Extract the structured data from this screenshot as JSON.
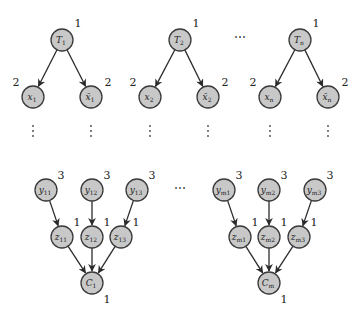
{
  "diagram": {
    "type": "directed-graph",
    "variable_gadgets": [
      {
        "root": {
          "id": "T1",
          "base": "T",
          "sub": "1",
          "weight": "1",
          "x": 62,
          "y": 40
        },
        "children": [
          {
            "id": "x1",
            "base": "x",
            "sub": "1",
            "bar": false,
            "weight": "2",
            "x": 33,
            "y": 97,
            "weight_side": "left"
          },
          {
            "id": "xbar1",
            "base": "x̄",
            "sub": "1",
            "bar": true,
            "weight": "2",
            "x": 91,
            "y": 97,
            "weight_side": "right"
          }
        ]
      },
      {
        "root": {
          "id": "T2",
          "base": "T",
          "sub": "2",
          "weight": "1",
          "x": 180,
          "y": 40
        },
        "children": [
          {
            "id": "x2",
            "base": "x",
            "sub": "2",
            "bar": false,
            "weight": "2",
            "x": 150,
            "y": 97,
            "weight_side": "left"
          },
          {
            "id": "xbar2",
            "base": "x̄",
            "sub": "2",
            "bar": true,
            "weight": "2",
            "x": 208,
            "y": 97,
            "weight_side": "right"
          }
        ]
      },
      {
        "root": {
          "id": "Tn",
          "base": "T",
          "sub": "n",
          "weight": "1",
          "x": 300,
          "y": 40
        },
        "children": [
          {
            "id": "xn",
            "base": "x",
            "sub": "n",
            "bar": false,
            "weight": "2",
            "x": 270,
            "y": 97,
            "weight_side": "left"
          },
          {
            "id": "xbarn",
            "base": "x̄",
            "sub": "n",
            "bar": true,
            "weight": "2",
            "x": 328,
            "y": 97,
            "weight_side": "right"
          }
        ]
      }
    ],
    "clause_gadgets": [
      {
        "sink": {
          "id": "C1",
          "base": "C",
          "sub": "1",
          "weight": "1",
          "x": 92,
          "y": 283
        },
        "branches": [
          {
            "y": {
              "id": "y11",
              "base": "y",
              "sub": "11",
              "weight": "3",
              "x": 46,
              "y": 190
            },
            "z": {
              "id": "z11",
              "base": "z",
              "sub": "11",
              "weight": "1",
              "x": 62,
              "y": 237
            }
          },
          {
            "y": {
              "id": "y12",
              "base": "y",
              "sub": "12",
              "weight": "3",
              "x": 92,
              "y": 190
            },
            "z": {
              "id": "z12",
              "base": "z",
              "sub": "12",
              "weight": "1",
              "x": 92,
              "y": 237
            }
          },
          {
            "y": {
              "id": "y13",
              "base": "y",
              "sub": "13",
              "weight": "3",
              "x": 137,
              "y": 190
            },
            "z": {
              "id": "z13",
              "base": "z",
              "sub": "13",
              "weight": "1",
              "x": 121,
              "y": 237
            }
          }
        ]
      },
      {
        "sink": {
          "id": "Cm",
          "base": "C",
          "sub": "m",
          "weight": "1",
          "x": 269,
          "y": 283
        },
        "branches": [
          {
            "y": {
              "id": "ym1",
              "base": "y",
              "sub": "m1",
              "weight": "3",
              "x": 224,
              "y": 190
            },
            "z": {
              "id": "zm1",
              "base": "z",
              "sub": "m1",
              "weight": "1",
              "x": 240,
              "y": 237
            }
          },
          {
            "y": {
              "id": "ym2",
              "base": "y",
              "sub": "m2",
              "weight": "3",
              "x": 269,
              "y": 190
            },
            "z": {
              "id": "zm2",
              "base": "z",
              "sub": "m2",
              "weight": "1",
              "x": 269,
              "y": 237
            }
          },
          {
            "y": {
              "id": "ym3",
              "base": "y",
              "sub": "m3",
              "weight": "3",
              "x": 315,
              "y": 190
            },
            "z": {
              "id": "zm3",
              "base": "z",
              "sub": "m3",
              "weight": "1",
              "x": 299,
              "y": 237
            }
          }
        ]
      }
    ],
    "ellipses": [
      {
        "text": "⋯",
        "x": 240,
        "y": 37
      },
      {
        "text": "⋯",
        "x": 180,
        "y": 188
      }
    ],
    "node_fill": "#c8c8c8",
    "node_stroke": "#3a3a3a",
    "edge_color": "#2b2b2b"
  }
}
